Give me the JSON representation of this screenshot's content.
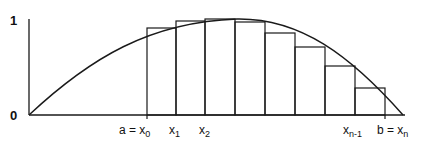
{
  "diagram": {
    "y_axis": {
      "labels": [
        {
          "text": "1",
          "y": 1
        },
        {
          "text": "0",
          "y": 0
        }
      ]
    },
    "x_labels": [
      {
        "main": "a = x",
        "sub": "0"
      },
      {
        "main": "x",
        "sub": "1"
      },
      {
        "main": "x",
        "sub": "2"
      },
      {
        "main": "x",
        "sub": "n-1"
      },
      {
        "main": "b = x",
        "sub": "n"
      }
    ],
    "partition_count": 8,
    "colors": {
      "line": "#1a1a1a",
      "background": "#ffffff"
    }
  }
}
